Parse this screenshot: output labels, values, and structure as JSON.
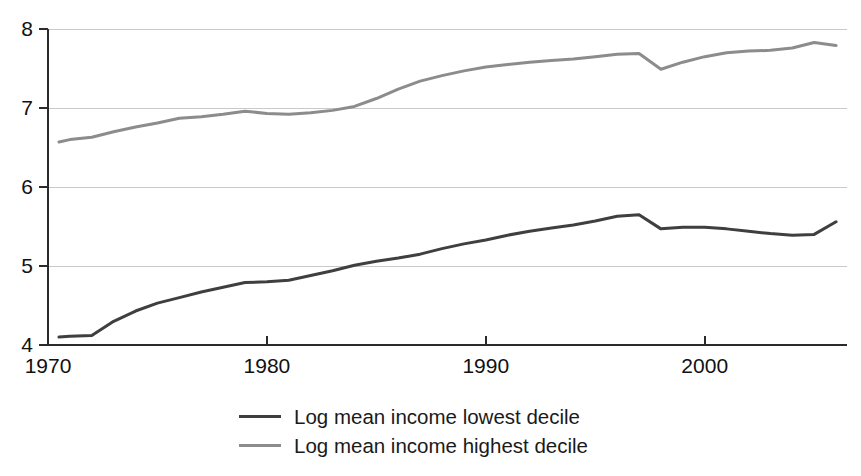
{
  "chart_data": {
    "type": "line",
    "title": "",
    "xlabel": "",
    "ylabel": "",
    "xlim": [
      1970,
      2006.5
    ],
    "ylim": [
      4,
      8
    ],
    "grid": true,
    "grid_axis": "y",
    "legend_position": "bottom",
    "x_ticks": [
      1970,
      1980,
      1990,
      2000
    ],
    "x_tick_labels": [
      "1970",
      "1980",
      "1990",
      "2000"
    ],
    "y_ticks": [
      4,
      5,
      6,
      7,
      8
    ],
    "y_tick_labels": [
      "4",
      "5",
      "6",
      "7",
      "8"
    ],
    "x": [
      1970.5,
      1971,
      1972,
      1973,
      1974,
      1975,
      1976,
      1977,
      1978,
      1979,
      1980,
      1981,
      1982,
      1983,
      1984,
      1985,
      1986,
      1987,
      1988,
      1989,
      1990,
      1991,
      1992,
      1993,
      1994,
      1995,
      1996,
      1997,
      1998,
      1999,
      2000,
      2001,
      2002,
      2003,
      2004,
      2005,
      2006
    ],
    "series": [
      {
        "name": "Log mean income lowest decile",
        "color": "#3f3f3f",
        "values": [
          4.1,
          4.11,
          4.12,
          4.3,
          4.43,
          4.53,
          4.6,
          4.67,
          4.73,
          4.79,
          4.8,
          4.82,
          4.88,
          4.94,
          5.01,
          5.06,
          5.1,
          5.15,
          5.22,
          5.28,
          5.33,
          5.39,
          5.44,
          5.48,
          5.52,
          5.57,
          5.63,
          5.65,
          5.47,
          5.49,
          5.49,
          5.47,
          5.44,
          5.41,
          5.39,
          5.4,
          5.56
        ]
      },
      {
        "name": "Log mean income highest decile",
        "color": "#8c8c8c",
        "values": [
          6.57,
          6.6,
          6.63,
          6.7,
          6.76,
          6.81,
          6.87,
          6.89,
          6.92,
          6.96,
          6.93,
          6.92,
          6.94,
          6.97,
          7.02,
          7.12,
          7.24,
          7.34,
          7.41,
          7.47,
          7.52,
          7.55,
          7.58,
          7.6,
          7.62,
          7.65,
          7.68,
          7.69,
          7.49,
          7.58,
          7.65,
          7.7,
          7.72,
          7.73,
          7.76,
          7.83,
          7.79
        ]
      }
    ]
  },
  "legend": {
    "items": [
      {
        "label": "Log mean income lowest decile",
        "color": "#3f3f3f"
      },
      {
        "label": "Log mean income highest decile",
        "color": "#8c8c8c"
      }
    ]
  },
  "axes": {
    "axis_color": "#2b2b2b",
    "grid_color": "#c9c9c9"
  }
}
